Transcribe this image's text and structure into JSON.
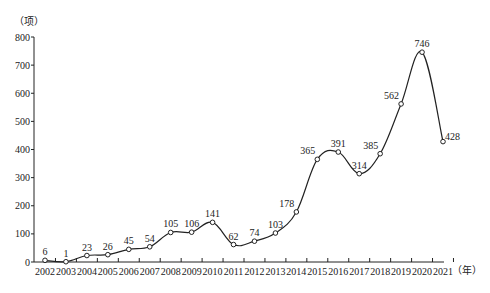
{
  "chart_data": {
    "type": "line",
    "title": "",
    "xlabel": "（年）",
    "ylabel": "（项）",
    "categories": [
      "2002",
      "2003",
      "2004",
      "2005",
      "2006",
      "2007",
      "2008",
      "2009",
      "2010",
      "2011",
      "2012",
      "2013",
      "2014",
      "2015",
      "2016",
      "2017",
      "2018",
      "2019",
      "2020",
      "2021"
    ],
    "series": [
      {
        "name": "count",
        "values": [
          6,
          1,
          23,
          26,
          45,
          54,
          105,
          106,
          141,
          62,
          74,
          103,
          178,
          365,
          391,
          314,
          385,
          562,
          746,
          428
        ]
      }
    ],
    "ylim": [
      0,
      800
    ],
    "yticks": [
      0,
      100,
      200,
      300,
      400,
      500,
      600,
      700,
      800
    ],
    "grid": false,
    "legend": null,
    "marker": "hollow-circle",
    "smooth": true
  },
  "labels": {
    "y_unit": "（项）",
    "x_unit": "（年）"
  }
}
